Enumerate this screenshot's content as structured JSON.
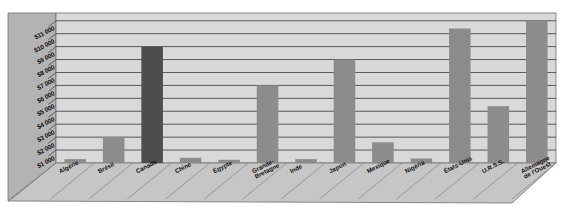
{
  "chart_data": {
    "type": "bar",
    "title": "",
    "subtitle": "",
    "xlabel": "",
    "ylabel": "",
    "categories": [
      "Algérie",
      "Brésil",
      "Canada",
      "Chine",
      "Égypte",
      "Grande-Bretagne",
      "Inde",
      "Japon",
      "Mexique",
      "Nigéria",
      "États-Unis",
      "U.R.S.S.",
      "Allemagne de l'Ouest"
    ],
    "category_lines": [
      [
        "Algérie"
      ],
      [
        "Brésil"
      ],
      [
        "Canada"
      ],
      [
        "Chine"
      ],
      [
        "Égypte"
      ],
      [
        "Grande-",
        "Bretagne"
      ],
      [
        "Inde"
      ],
      [
        "Japon"
      ],
      [
        "Mexique"
      ],
      [
        "Nigéria"
      ],
      [
        "États-Unis"
      ],
      [
        "U.R.S.S."
      ],
      [
        "Allemagne",
        "de l'Ouest"
      ]
    ],
    "values": [
      300,
      2000,
      9000,
      400,
      250,
      6000,
      300,
      8000,
      1600,
      350,
      10400,
      4400,
      11000
    ],
    "ylim": [
      0,
      11600
    ],
    "yticks": [
      1000,
      2000,
      3000,
      4000,
      5000,
      6000,
      7000,
      8000,
      9000,
      10000,
      11000
    ],
    "ytick_labels": [
      "$1 000",
      "$2 000",
      "$3 000",
      "$4 000",
      "$5 000",
      "$6 000",
      "$7 000",
      "$8 000",
      "$9 000",
      "$10 000",
      "$11 000"
    ],
    "grid": true,
    "legend": "none",
    "bar_colors": [
      "#8c8c8c",
      "#8c8c8c",
      "#4d4d4d",
      "#8c8c8c",
      "#8c8c8c",
      "#8c8c8c",
      "#8c8c8c",
      "#8c8c8c",
      "#8c8c8c",
      "#8c8c8c",
      "#8c8c8c",
      "#8c8c8c",
      "#8c8c8c"
    ],
    "colors": {
      "plot_background": "#d9d9d9",
      "wall_side": "#b3b3b3",
      "floor": "#c6c6c6",
      "gridline": "#4a4a4a",
      "bar_default": "#8c8c8c",
      "bar_highlight": "#4d4d4d",
      "text": "#111111",
      "page_background": "#ffffff"
    }
  }
}
